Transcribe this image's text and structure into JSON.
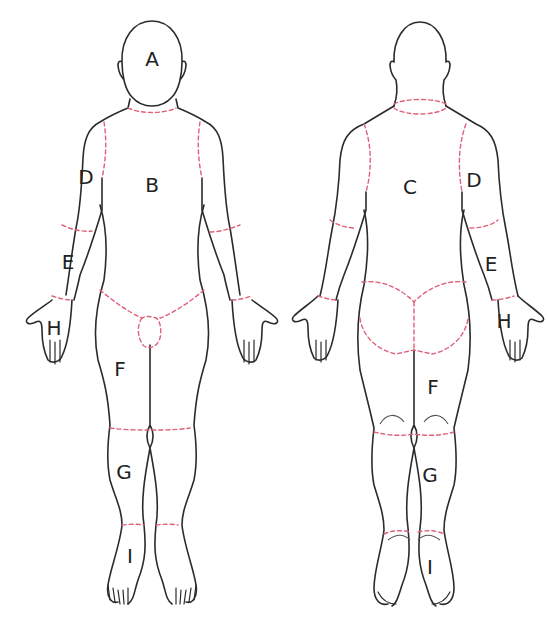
{
  "diagram": {
    "title": "",
    "colors": {
      "outline": "#2b2b2b",
      "region_boundary": "#e0607a",
      "background": "#ffffff"
    },
    "front_view": {
      "labels": {
        "head": "A",
        "chest": "B",
        "upper_arm": "D",
        "forearm": "E",
        "hand": "H",
        "thigh": "F",
        "lower_leg": "G",
        "foot": "I"
      }
    },
    "back_view": {
      "labels": {
        "back": "C",
        "upper_arm": "D",
        "forearm": "E",
        "hand": "H",
        "thigh": "F",
        "lower_leg": "G",
        "foot": "I"
      }
    }
  }
}
